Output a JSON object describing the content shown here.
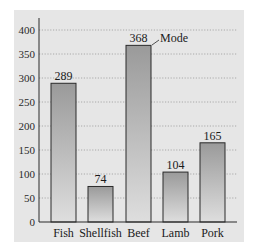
{
  "chart_data": {
    "type": "bar",
    "title": "",
    "xlabel": "",
    "ylabel": "",
    "categories": [
      "Fish",
      "Shellfish",
      "Beef",
      "Lamb",
      "Pork"
    ],
    "values": [
      289,
      74,
      368,
      104,
      165
    ],
    "ylim": [
      0,
      400
    ],
    "yticks": [
      0,
      50,
      100,
      150,
      200,
      250,
      300,
      350,
      400
    ],
    "grid": "horizontal dotted",
    "legend": null,
    "annotations": [
      {
        "target": "Beef",
        "text": "Mode"
      }
    ],
    "colors": {
      "panel": "#e6e6e6",
      "bar_top": "#9a9a9a",
      "bar_bottom": "#dcdcdc",
      "bar_edge": "#2a2a2a",
      "grid": "#9a9a9a"
    }
  },
  "labels": {
    "mode": "Mode",
    "yticks": [
      "0",
      "50",
      "100",
      "150",
      "200",
      "250",
      "300",
      "350",
      "400"
    ],
    "categories": [
      "Fish",
      "Shellfish",
      "Beef",
      "Lamb",
      "Pork"
    ],
    "values": [
      "289",
      "74",
      "368",
      "104",
      "165"
    ]
  }
}
